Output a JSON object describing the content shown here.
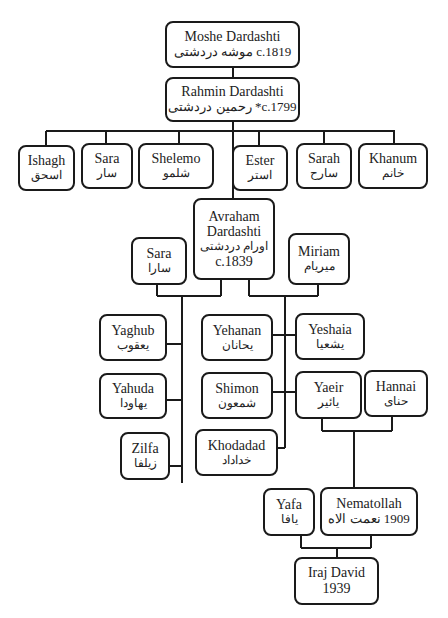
{
  "people": {
    "moshe": {
      "en": "Moshe Dardashti",
      "line2": "c.1819 موشه دردشتی"
    },
    "rahmin": {
      "en": "Rahmin Dardashti",
      "line2": "c.1799* رحمین دردشتی"
    },
    "ishagh": {
      "en": "Ishagh",
      "fa": "اسحق"
    },
    "sara1": {
      "en": "Sara",
      "fa": "سار"
    },
    "shelemo": {
      "en": "Shelemo",
      "fa": "شلمو"
    },
    "ester": {
      "en": "Ester",
      "fa": "استر"
    },
    "sarah": {
      "en": "Sarah",
      "fa": "سارح"
    },
    "khanum": {
      "en": "Khanum",
      "fa": "خانم"
    },
    "avraham": {
      "en1": "Avraham",
      "en2": "Dardashti",
      "fa": "اورام دردشتی",
      "year": "c.1839"
    },
    "sara2": {
      "en": "Sara",
      "fa": "سارا"
    },
    "miriam": {
      "en": "Miriam",
      "fa": "میریام"
    },
    "yaghub": {
      "en": "Yaghub",
      "fa": "یعقوب"
    },
    "yahuda": {
      "en": "Yahuda",
      "fa": "یهاودا"
    },
    "zilfa": {
      "en": "Zilfa",
      "fa": "زیلفا"
    },
    "yehanan": {
      "en": "Yehanan",
      "fa": "یحانان"
    },
    "shimon": {
      "en": "Shimon",
      "fa": "شمعون"
    },
    "khodadad": {
      "en": "Khodadad",
      "fa": "خداداد"
    },
    "yeshaia": {
      "en": "Yeshaia",
      "fa": "یشعیا"
    },
    "yaeir": {
      "en": "Yaeir",
      "fa": "یائیر"
    },
    "hannai": {
      "en": "Hannai",
      "fa": "حنای"
    },
    "yafa": {
      "en": "Yafa",
      "fa": "یافا"
    },
    "nematollah": {
      "en": "Nematollah",
      "line2": "1909 نعمت الاه"
    },
    "iraj": {
      "en": "Iraj David",
      "year": "1939"
    }
  },
  "colors": {
    "line": "#1a1a1a",
    "box_border": "#1a1a1a",
    "background": "#ffffff"
  }
}
